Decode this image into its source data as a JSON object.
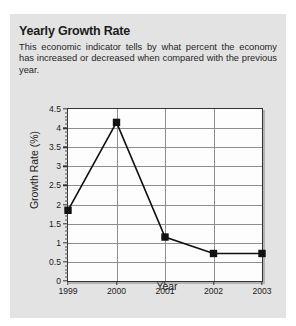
{
  "card": {
    "title": "Yearly Growth Rate",
    "description": "This economic indicator tells by what percent the economy has increased or decreased when compared with the previous year.",
    "panel_color": "#e3e3e3",
    "text_color": "#1c1c1c"
  },
  "chart_data": {
    "type": "line",
    "title": "",
    "xlabel": "Year",
    "ylabel": "Growth Rate (%)",
    "categories": [
      "1999",
      "2000",
      "2001",
      "2002",
      "2003"
    ],
    "values": [
      1.85,
      4.15,
      1.15,
      0.72,
      0.72
    ],
    "ylim": [
      0,
      4.5
    ],
    "ytick_labels": [
      "0",
      "0.5",
      "1",
      "1.5",
      "2",
      "2.5",
      "3",
      "3.5",
      "4",
      "4.5"
    ],
    "ytick_values": [
      0,
      0.5,
      1,
      1.5,
      2,
      2.5,
      3,
      3.5,
      4,
      4.5
    ],
    "minor_tick_step": 0.1,
    "grid": "horizontal-and-vertical",
    "legend": "none",
    "marker": "filled-square",
    "marker_color": "#111111",
    "line_color": "#111111",
    "grid_color": "#8e8e8e",
    "plot_bg": "#fdfdfd",
    "plot_border_color": "#333333"
  }
}
